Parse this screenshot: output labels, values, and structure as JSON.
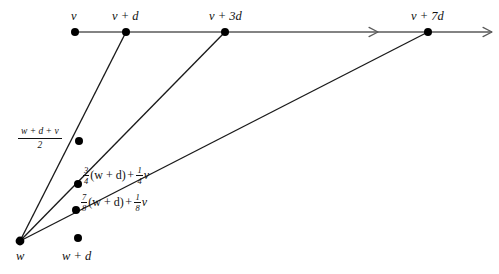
{
  "figure": {
    "type": "geometric-diagram",
    "background": "#ffffff",
    "ray_color": "#5a5a5a",
    "line_color": "#1a1a1a",
    "dot_color": "#000000"
  },
  "ray": {
    "label": "horizontal-ray",
    "y": 32,
    "x_start": 75,
    "x_end": 492,
    "arrow_mid_x": 378,
    "arrow_end_x": 492
  },
  "top_points": [
    {
      "name": "v",
      "label": "v",
      "x": 75,
      "y": 32,
      "label_x": 71,
      "label_y": 10
    },
    {
      "name": "v+d",
      "label": "v + d",
      "x": 126,
      "y": 32,
      "label_x": 112,
      "label_y": 10
    },
    {
      "name": "v+3d",
      "label": "v + 3d",
      "x": 225,
      "y": 32,
      "label_x": 209,
      "label_y": 10
    },
    {
      "name": "v+7d",
      "label": "v + 7d",
      "x": 428,
      "y": 32,
      "label_x": 411,
      "label_y": 10
    }
  ],
  "apex": {
    "name": "w",
    "label": "w",
    "x": 20,
    "y": 241,
    "label_x": 16,
    "label_y": 250
  },
  "lower_point": {
    "name": "w+d",
    "label": "w + d",
    "x": 78,
    "y": 238,
    "label_x": 62,
    "label_y": 250
  },
  "interior_points": [
    {
      "name": "midpoint-half",
      "x": 79,
      "y": 141,
      "label_kind": "stacked-fraction",
      "numerator": "w + d + v",
      "denominator": "2",
      "label_x": 18,
      "label_y": 127
    },
    {
      "name": "point-three-quarters",
      "x": 78,
      "y": 184,
      "label_kind": "expression",
      "coef1_num": "3",
      "coef1_den": "4",
      "term1": "(w + d)",
      "operator": "+",
      "coef2_num": "1",
      "coef2_den": "4",
      "term2": "v",
      "label_x": 82,
      "label_y": 166
    },
    {
      "name": "point-seven-eighths",
      "x": 76,
      "y": 210,
      "label_kind": "expression",
      "coef1_num": "7",
      "coef1_den": "8",
      "term1": "(w + d)",
      "operator": "+",
      "coef2_num": "1",
      "coef2_den": "8",
      "term2": "v",
      "label_x": 80,
      "label_y": 193
    }
  ],
  "segments": [
    {
      "name": "segment-w-to-v-plus-d",
      "x1": 20,
      "y1": 241,
      "x2": 126,
      "y2": 32
    },
    {
      "name": "segment-w-to-v-plus-3d",
      "x1": 20,
      "y1": 241,
      "x2": 225,
      "y2": 32
    },
    {
      "name": "segment-w-to-v-plus-7d",
      "x1": 20,
      "y1": 241,
      "x2": 428,
      "y2": 32
    }
  ]
}
